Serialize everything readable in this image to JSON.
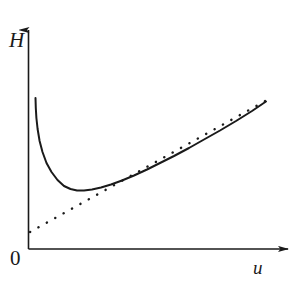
{
  "figure": {
    "caption_fragment": "",
    "background_color": "#ffffff",
    "ink_color": "#1a1a1a",
    "width": 297,
    "height": 285
  },
  "axes": {
    "y_axis": {
      "label": "H",
      "name": "enthalpy-axis",
      "arrow": true,
      "x_px": 28.5,
      "top_px": 28,
      "bottom_px": 249
    },
    "x_axis": {
      "label": "u",
      "name": "velocity-axis",
      "arrow": true,
      "y_px": 249,
      "left_px": 28.5,
      "right_px": 290
    },
    "origin_label": "0"
  },
  "chart_data": {
    "type": "line",
    "title": "",
    "xlabel": "u",
    "ylabel": "H",
    "xlim": [
      0,
      297
    ],
    "ylim": [
      0,
      285
    ],
    "grid": false,
    "legend": null,
    "axis_units": "arbitrary",
    "series": [
      {
        "name": "stagnation-enthalpy-curve",
        "style": "solid",
        "color": "#1a1a1a",
        "width": 2.0,
        "description": "Curve falling steeply from the vertical axis to a minimum, then rising asymptotically toward the straight dotted line.",
        "points": [
          [
            35.5,
            98
          ],
          [
            35.8,
            108
          ],
          [
            36.4,
            118
          ],
          [
            37.6,
            129
          ],
          [
            39.6,
            141
          ],
          [
            42.5,
            152
          ],
          [
            46.5,
            163
          ],
          [
            51.5,
            172
          ],
          [
            57.5,
            180
          ],
          [
            64.0,
            186
          ],
          [
            70.5,
            189
          ],
          [
            77.0,
            190.5
          ],
          [
            84.0,
            190.5
          ],
          [
            92.0,
            189.5
          ],
          [
            101.0,
            187.5
          ],
          [
            111.0,
            184.5
          ],
          [
            122.0,
            180.5
          ],
          [
            134.0,
            175.5
          ],
          [
            147.0,
            169.5
          ],
          [
            160.0,
            163.0
          ],
          [
            174.0,
            156.0
          ],
          [
            189.0,
            148.0
          ],
          [
            204.0,
            139.5
          ],
          [
            220.0,
            130.5
          ],
          [
            236.0,
            121.0
          ],
          [
            252.0,
            111.0
          ],
          [
            266.0,
            101.5
          ]
        ]
      },
      {
        "name": "linear-asymptote",
        "style": "dotted",
        "color": "#1a1a1a",
        "width": 2.4,
        "description": "Straight dotted line from just above the origin rising to meet the curve at the upper right.",
        "points": [
          [
            30.0,
            232.0
          ],
          [
            267.0,
            100.0
          ]
        ],
        "slope": -0.557,
        "start": [
          30.0,
          232.0
        ],
        "end": [
          267.0,
          100.0
        ]
      }
    ],
    "annotations": [
      {
        "text": "H",
        "x": 14,
        "y": 40,
        "name": "y-axis-label"
      },
      {
        "text": "u",
        "x": 259,
        "y": 268,
        "name": "x-axis-label"
      },
      {
        "text": "0",
        "x": 16,
        "y": 259,
        "name": "origin-label"
      }
    ]
  }
}
